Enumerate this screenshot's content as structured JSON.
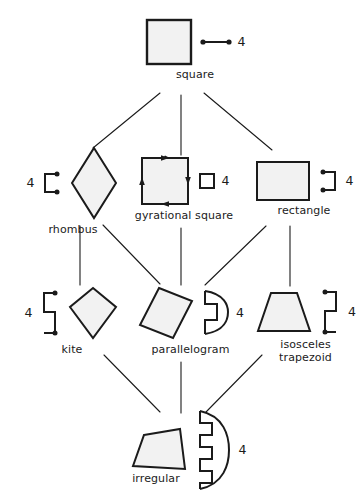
{
  "diagram": {
    "stroke_color": "#1b1b1b",
    "fill_color": "#f2f2f2",
    "background": "#ffffff",
    "nodes": [
      {
        "id": "square",
        "label": "square",
        "shape": "square",
        "symmetry_symbol": "line-segment-two-dots",
        "symmetry_count": "4",
        "symbol_side": "right"
      },
      {
        "id": "rhombus",
        "label": "rhombus",
        "shape": "rhombus",
        "symmetry_symbol": "bracket-open-right-two-dots",
        "symmetry_count": "4",
        "symbol_side": "left"
      },
      {
        "id": "gyrational-square",
        "label": "gyrational square",
        "shape": "square-with-rotation-arrows",
        "symmetry_symbol": "small-square",
        "symmetry_count": "4",
        "symbol_side": "right"
      },
      {
        "id": "rectangle",
        "label": "rectangle",
        "shape": "rectangle",
        "symmetry_symbol": "bracket-open-left-two-dots",
        "symmetry_count": "4",
        "symbol_side": "right"
      },
      {
        "id": "kite",
        "label": "kite",
        "shape": "kite",
        "symmetry_symbol": "double-bracket-s-two-dots",
        "symmetry_count": "4",
        "symbol_side": "left"
      },
      {
        "id": "parallelogram",
        "label": "parallelogram",
        "shape": "parallelogram",
        "symmetry_symbol": "d-arc-with-notch",
        "symmetry_count": "4",
        "symbol_side": "right"
      },
      {
        "id": "isosceles-trapezoid",
        "label": "isosceles\ntrapezoid",
        "shape": "isosceles-trapezoid",
        "symmetry_symbol": "double-bracket-reversed-two-dots",
        "symmetry_count": "4",
        "symbol_side": "right"
      },
      {
        "id": "irregular",
        "label": "irregular",
        "shape": "irregular-quadrilateral",
        "symmetry_symbol": "comb-arc-three-notches",
        "symmetry_count": "4",
        "symbol_side": "right"
      }
    ],
    "edges": [
      {
        "from": "square",
        "to": "rhombus"
      },
      {
        "from": "square",
        "to": "gyrational-square"
      },
      {
        "from": "square",
        "to": "rectangle"
      },
      {
        "from": "rhombus",
        "to": "kite"
      },
      {
        "from": "rhombus",
        "to": "parallelogram"
      },
      {
        "from": "gyrational-square",
        "to": "parallelogram"
      },
      {
        "from": "rectangle",
        "to": "parallelogram"
      },
      {
        "from": "rectangle",
        "to": "isosceles-trapezoid"
      },
      {
        "from": "kite",
        "to": "irregular"
      },
      {
        "from": "parallelogram",
        "to": "irregular"
      },
      {
        "from": "isosceles-trapezoid",
        "to": "irregular"
      }
    ]
  }
}
